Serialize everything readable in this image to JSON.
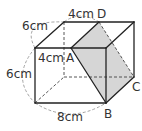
{
  "figure": {
    "type": "rectangular prism (cuboid) with shaded cross-section",
    "shade_color": "#d6d6d6",
    "edge_color": "#222222",
    "dimensions": {
      "depth_label": "6cm",
      "top_back_segment_label": "4cm",
      "front_top_segment_label": "4cm",
      "height_label": "6cm",
      "width_label": "8cm"
    },
    "points": {
      "A": "A",
      "B": "B",
      "C": "C",
      "D": "D"
    },
    "shaded_plane": "ADCB"
  }
}
